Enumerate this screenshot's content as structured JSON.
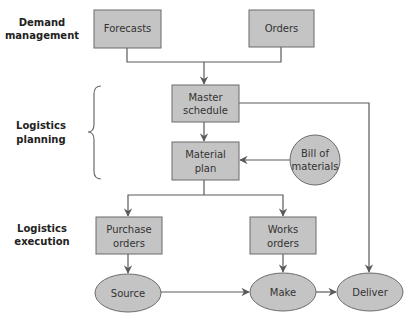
{
  "colors": {
    "node_fill": "#c4c4c4",
    "node_stroke": "#6b6b6b",
    "line": "#5a5a5a",
    "text": "#333333",
    "label_text": "#222222"
  },
  "side_labels": {
    "demand": {
      "line1": "Demand",
      "line2": "management"
    },
    "planning": {
      "line1": "Logistics",
      "line2": "planning"
    },
    "execution": {
      "line1": "Logistics",
      "line2": "execution"
    }
  },
  "nodes": {
    "forecasts": {
      "shape": "rect",
      "line1": "Forecasts"
    },
    "orders": {
      "shape": "rect",
      "line1": "Orders"
    },
    "master_schedule": {
      "shape": "rect",
      "line1": "Master",
      "line2": "schedule"
    },
    "material_plan": {
      "shape": "rect",
      "line1": "Material",
      "line2": "plan"
    },
    "bill_of_materials": {
      "shape": "circle",
      "line1": "Bill of",
      "line2": "materials"
    },
    "purchase_orders": {
      "shape": "rect",
      "line1": "Purchase",
      "line2": "orders"
    },
    "works_orders": {
      "shape": "rect",
      "line1": "Works",
      "line2": "orders"
    },
    "source": {
      "shape": "ellipse",
      "line1": "Source"
    },
    "make": {
      "shape": "ellipse",
      "line1": "Make"
    },
    "deliver": {
      "shape": "ellipse",
      "line1": "Deliver"
    }
  },
  "edges": [
    {
      "from": "Forecasts",
      "to": "Master schedule"
    },
    {
      "from": "Orders",
      "to": "Master schedule"
    },
    {
      "from": "Master schedule",
      "to": "Material plan"
    },
    {
      "from": "Master schedule",
      "to": "Deliver"
    },
    {
      "from": "Bill of materials",
      "to": "Material plan"
    },
    {
      "from": "Material plan",
      "to": "Purchase orders"
    },
    {
      "from": "Material plan",
      "to": "Works orders"
    },
    {
      "from": "Purchase orders",
      "to": "Source"
    },
    {
      "from": "Works orders",
      "to": "Make"
    },
    {
      "from": "Source",
      "to": "Make"
    },
    {
      "from": "Make",
      "to": "Deliver"
    }
  ]
}
